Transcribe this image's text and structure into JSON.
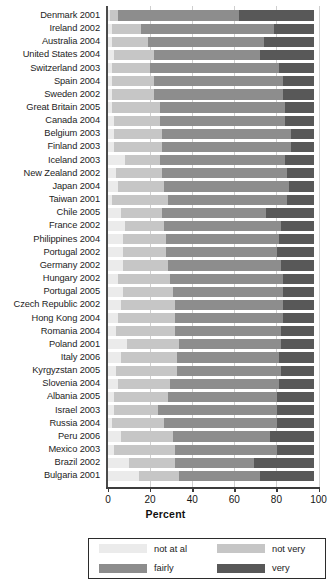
{
  "chart_data": {
    "type": "bar",
    "subtype": "stacked-horizontal-100pct",
    "title": "",
    "xlabel": "Percent",
    "ylabel": "",
    "xlim": [
      0,
      100
    ],
    "xticks": [
      0,
      20,
      40,
      60,
      80,
      100
    ],
    "grid": true,
    "legend_position": "bottom",
    "categories": [
      "Denmark 2001",
      "Ireland 2002",
      "Australia 2004",
      "United States 2004",
      "Switzerland 2003",
      "Spain 2004",
      "Sweden 2002",
      "Great Britain 2005",
      "Canada 2004",
      "Belgium 2003",
      "Finland 2003",
      "Iceland 2003",
      "New Zealand 2002",
      "Japan 2004",
      "Taiwan 2001",
      "Chile 2005",
      "France 2002",
      "Philippines 2004",
      "Portugal 2002",
      "Germany 2002",
      "Hungary 2002",
      "Portugal 2005",
      "Czech Republic 2002",
      "Hong Kong 2004",
      "Romania 2004",
      "Poland 2001",
      "Italy 2006",
      "Kyrgyzstan 2005",
      "Slovenia 2004",
      "Albania 2005",
      "Israel 2003",
      "Russia 2004",
      "Peru 2006",
      "Mexico 2003",
      "Brazil 2002",
      "Bulgaria 2001"
    ],
    "series": [
      {
        "name": "not at al",
        "color": "#ebebeb",
        "values": [
          2,
          3,
          3,
          4,
          3,
          3,
          3,
          3,
          4,
          4,
          4,
          9,
          5,
          6,
          3,
          7,
          9,
          8,
          8,
          8,
          6,
          8,
          7,
          6,
          5,
          10,
          7,
          5,
          6,
          4,
          4,
          3,
          7,
          4,
          11,
          16
        ]
      },
      {
        "name": "not very",
        "color": "#c6c6c6",
        "values": [
          4,
          14,
          17,
          19,
          18,
          20,
          20,
          23,
          22,
          23,
          23,
          17,
          22,
          22,
          27,
          20,
          19,
          21,
          21,
          22,
          25,
          24,
          26,
          27,
          28,
          25,
          27,
          29,
          25,
          26,
          21,
          25,
          25,
          29,
          22,
          19
        ]
      },
      {
        "name": "fairly",
        "color": "#8d8d8d",
        "values": [
          58,
          64,
          56,
          51,
          62,
          62,
          62,
          60,
          60,
          62,
          62,
          60,
          60,
          60,
          57,
          50,
          56,
          54,
          53,
          54,
          54,
          53,
          52,
          52,
          51,
          49,
          49,
          50,
          52,
          52,
          57,
          54,
          47,
          49,
          38,
          39
        ]
      },
      {
        "name": "very",
        "color": "#585858",
        "values": [
          36,
          19,
          24,
          26,
          17,
          15,
          15,
          14,
          14,
          11,
          11,
          14,
          13,
          12,
          13,
          23,
          16,
          17,
          18,
          16,
          15,
          15,
          15,
          15,
          16,
          16,
          17,
          16,
          17,
          18,
          18,
          18,
          21,
          18,
          29,
          26
        ]
      }
    ]
  },
  "axis": {
    "tick_labels": [
      "0",
      "20",
      "40",
      "60",
      "80",
      "100"
    ],
    "title": "Percent"
  },
  "legend": {
    "items": [
      {
        "label": "not at al",
        "color": "#ebebeb"
      },
      {
        "label": "not very",
        "color": "#c6c6c6"
      },
      {
        "label": "fairly",
        "color": "#8d8d8d"
      },
      {
        "label": "very",
        "color": "#585858"
      }
    ]
  }
}
